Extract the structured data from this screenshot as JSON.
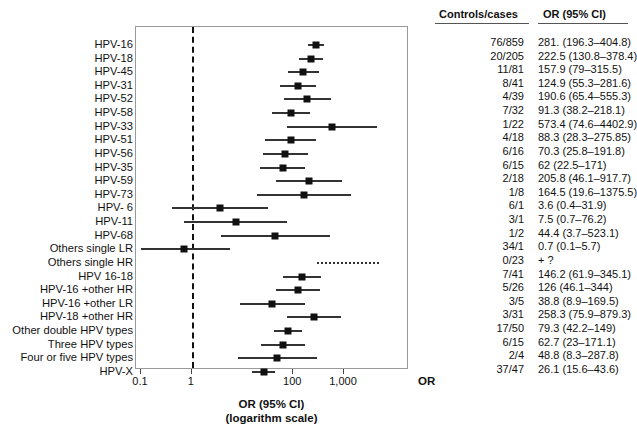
{
  "figure": {
    "axis_title_line1": "OR (95% CI)",
    "axis_title_line2": "(logarithm scale)",
    "axis_or_tag": "OR",
    "accent_color": "#111111",
    "marker_color": "#111111",
    "frame_color": "#9a9a9a"
  },
  "columns": {
    "controls_cases_header": "Controls/cases",
    "or_header": "OR (95% CI)"
  },
  "chart_data": {
    "type": "forest",
    "title": "",
    "xlabel": "OR (95% CI) (logarithm scale)",
    "ylabel": "",
    "xscale": "log",
    "xlim": [
      0.1,
      5000
    ],
    "ticks": [
      {
        "value": 0.1,
        "label": "0.1"
      },
      {
        "value": 1,
        "label": "1"
      },
      {
        "value": 100,
        "label": "100"
      },
      {
        "value": 1000,
        "label": "1,000"
      }
    ],
    "reference_line": 1,
    "grid": false,
    "legend": "none",
    "rows": [
      {
        "label": "HPV-16",
        "controls_cases": "76/859",
        "or_text": "281. (196.3–404.8)",
        "or": 281,
        "lo": 196.3,
        "hi": 404.8
      },
      {
        "label": "HPV-18",
        "controls_cases": "20/205",
        "or_text": "222.5 (130.8–378.4)",
        "or": 222.5,
        "lo": 130.8,
        "hi": 378.4
      },
      {
        "label": "HPV-45",
        "controls_cases": "11/81",
        "or_text": "157.9 (79–315.5)",
        "or": 157.9,
        "lo": 79,
        "hi": 315.5
      },
      {
        "label": "HPV-31",
        "controls_cases": "8/41",
        "or_text": "124.9 (55.3–281.6)",
        "or": 124.9,
        "lo": 55.3,
        "hi": 281.6
      },
      {
        "label": "HPV-52",
        "controls_cases": "4/39",
        "or_text": "190.6 (65.4–555.3)",
        "or": 190.6,
        "lo": 65.4,
        "hi": 555.3
      },
      {
        "label": "HPV-58",
        "controls_cases": "7/32",
        "or_text": "91.3 (38.2–218.1)",
        "or": 91.3,
        "lo": 38.2,
        "hi": 218.1
      },
      {
        "label": "HPV-33",
        "controls_cases": "1/22",
        "or_text": "573.4 (74.6–4402.9)",
        "or": 573.4,
        "lo": 74.6,
        "hi": 4402.9
      },
      {
        "label": "HPV-51",
        "controls_cases": "4/18",
        "or_text": "88.3 (28.3–275.85)",
        "or": 88.3,
        "lo": 28.3,
        "hi": 275.85
      },
      {
        "label": "HPV-56",
        "controls_cases": "6/16",
        "or_text": "70.3 (25.8–191.8)",
        "or": 70.3,
        "lo": 25.8,
        "hi": 191.8
      },
      {
        "label": "HPV-35",
        "controls_cases": "6/15",
        "or_text": "62 (22.5–171)",
        "or": 62,
        "lo": 22.5,
        "hi": 171
      },
      {
        "label": "HPV-59",
        "controls_cases": "2/18",
        "or_text": "205.8 (46.1–917.7)",
        "or": 205.8,
        "lo": 46.1,
        "hi": 917.7
      },
      {
        "label": "HPV-73",
        "controls_cases": "1/8",
        "or_text": "164.5 (19.6–1375.5)",
        "or": 164.5,
        "lo": 19.6,
        "hi": 1375.5
      },
      {
        "label": "HPV- 6",
        "controls_cases": "6/1",
        "or_text": "3.6 (0.4–31.9)",
        "or": 3.6,
        "lo": 0.4,
        "hi": 31.9
      },
      {
        "label": "HPV-11",
        "controls_cases": "3/1",
        "or_text": "7.5 (0.7–76.2)",
        "or": 7.5,
        "lo": 0.7,
        "hi": 76.2
      },
      {
        "label": "HPV-68",
        "controls_cases": "1/2",
        "or_text": "44.4 (3.7–523.1)",
        "or": 44.4,
        "lo": 3.7,
        "hi": 523.1
      },
      {
        "label": "Others single LR",
        "controls_cases": "34/1",
        "or_text": "0.7 (0.1–5.7)",
        "or": 0.7,
        "lo": 0.1,
        "hi": 5.7
      },
      {
        "label": "Others single HR",
        "controls_cases": "0/23",
        "or_text": "+ ?",
        "or": null,
        "lo": 300,
        "hi": 5000,
        "style": "dashed"
      },
      {
        "label": "HPV 16-18",
        "controls_cases": "7/41",
        "or_text": "146.2 (61.9–345.1)",
        "or": 146.2,
        "lo": 61.9,
        "hi": 345.1
      },
      {
        "label": "HPV-16 +other HR",
        "controls_cases": "5/26",
        "or_text": "126 (46.1–344)",
        "or": 126,
        "lo": 46.1,
        "hi": 344
      },
      {
        "label": "HPV-16 +other LR",
        "controls_cases": "3/5",
        "or_text": "38.8 (8.9–169.5)",
        "or": 38.8,
        "lo": 8.9,
        "hi": 169.5
      },
      {
        "label": "HPV-18 +other HR",
        "controls_cases": "3/31",
        "or_text": "258.3 (75.9–879.3)",
        "or": 258.3,
        "lo": 75.9,
        "hi": 879.3
      },
      {
        "label": "Other double HPV types",
        "controls_cases": "17/50",
        "or_text": "79.3 (42.2–149)",
        "or": 79.3,
        "lo": 42.2,
        "hi": 149
      },
      {
        "label": "Three HPV types",
        "controls_cases": "6/15",
        "or_text": "62.7 (23–171.1)",
        "or": 62.7,
        "lo": 23,
        "hi": 171.1
      },
      {
        "label": "Four or five HPV types",
        "controls_cases": "2/4",
        "or_text": "48.8 (8.3–287.8)",
        "or": 48.8,
        "lo": 8.3,
        "hi": 287.8
      },
      {
        "label": "HPV-X",
        "controls_cases": "37/47",
        "or_text": "26.1 (15.6–43.6)",
        "or": 26.1,
        "lo": 15.6,
        "hi": 43.6
      }
    ]
  }
}
